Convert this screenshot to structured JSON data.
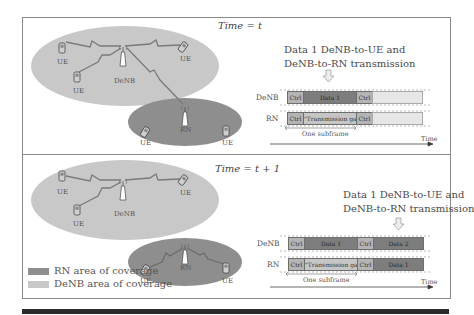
{
  "colors": {
    "denb_coverage": "#c8c8c8",
    "rn_coverage": "#8e8e8e",
    "ctrl": "#b4b4b4",
    "data": "#7d7d7d",
    "gap": "#c6c6c6",
    "empty": "#e6e6e6",
    "link": "#7a7a7a"
  },
  "top_panel": {
    "title": "Time = t",
    "nodes": {
      "denb": "DeNB",
      "rn": "RN",
      "ue_labels": [
        "UE",
        "UE",
        "UE",
        "UE",
        "UE"
      ]
    },
    "caption_line1": "Data 1 DeNB-to-UE and",
    "caption_line2": "DeNB-to-RN transmission",
    "timing": {
      "row1_label": "DeNB",
      "row2_label": "RN",
      "row1_segments": [
        "Ctrl",
        "Data 1",
        "Ctrl",
        ""
      ],
      "row2_segments": [
        "Ctrl",
        "\"Transmission gap\"",
        "Ctrl",
        ""
      ],
      "subframe_label": "One subframe",
      "axis_label": "Time"
    }
  },
  "bottom_panel": {
    "title": "Time = t + 1",
    "nodes": {
      "denb": "DeNB",
      "rn": "RN",
      "ue_labels": [
        "UE",
        "UE",
        "UE",
        "UE",
        "UE"
      ]
    },
    "caption_line1": "Data 1 DeNB-to-UE and",
    "caption_line2": "DeNB-to-RN transmission",
    "timing": {
      "row1_label": "DeNB",
      "row2_label": "RN",
      "row1_segments": [
        "Ctrl",
        "Data 1",
        "Ctrl",
        "Data 2"
      ],
      "row2_segments": [
        "Ctrl",
        "\"Transmission gap\"",
        "Ctrl",
        "Data 1"
      ],
      "subframe_label": "One subframe",
      "axis_label": "Time"
    },
    "legend": [
      {
        "label": "RN area of coverage",
        "swatch": "rn_coverage"
      },
      {
        "label": "DeNB area of coverage",
        "swatch": "denb_coverage"
      }
    ]
  }
}
